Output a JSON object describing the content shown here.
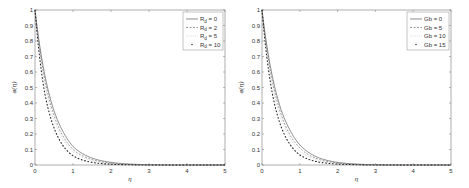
{
  "chart_data": [
    {
      "type": "line",
      "title": "",
      "xlabel": "η",
      "ylabel": "φ(η)",
      "xlim": [
        0,
        5
      ],
      "ylim": [
        0,
        1
      ],
      "xticks": [
        "0",
        "1",
        "2",
        "3",
        "4",
        "5"
      ],
      "yticks": [
        "0",
        "0.1",
        "0.2",
        "0.3",
        "0.4",
        "0.5",
        "0.6",
        "0.7",
        "0.8",
        "0.9",
        "1"
      ],
      "grid": false,
      "legend_position": "upper right",
      "x": [
        0,
        0.25,
        0.5,
        0.75,
        1,
        1.5,
        2,
        2.5,
        3,
        4,
        5
      ],
      "series": [
        {
          "name": "R_d = 0",
          "style": "solid",
          "values": [
            1,
            0.59,
            0.35,
            0.21,
            0.12,
            0.045,
            0.017,
            0.006,
            0.002,
            0.0,
            0.0
          ]
        },
        {
          "name": "R_d = 2",
          "style": "dashed",
          "values": [
            1,
            0.56,
            0.32,
            0.18,
            0.1,
            0.035,
            0.012,
            0.004,
            0.001,
            0.0,
            0.0
          ]
        },
        {
          "name": "R_d = 5",
          "style": "dotted-light",
          "values": [
            1,
            0.53,
            0.29,
            0.16,
            0.085,
            0.027,
            0.009,
            0.003,
            0.001,
            0.0,
            0.0
          ]
        },
        {
          "name": "R_d = 10",
          "style": "dotted",
          "values": [
            1,
            0.47,
            0.24,
            0.12,
            0.06,
            0.017,
            0.005,
            0.0015,
            0.0,
            0.0,
            0.0
          ]
        }
      ]
    },
    {
      "type": "line",
      "title": "",
      "xlabel": "η",
      "ylabel": "φ(η)",
      "xlim": [
        0,
        5
      ],
      "ylim": [
        0,
        1
      ],
      "xticks": [
        "0",
        "1",
        "2",
        "3",
        "4",
        "5"
      ],
      "yticks": [
        "0",
        "0.1",
        "0.2",
        "0.3",
        "0.4",
        "0.5",
        "0.6",
        "0.7",
        "0.8",
        "0.9",
        "1"
      ],
      "grid": false,
      "legend_position": "upper right",
      "x": [
        0,
        0.25,
        0.5,
        0.75,
        1,
        1.5,
        2,
        2.5,
        3,
        4,
        5
      ],
      "series": [
        {
          "name": "Gb = 0",
          "style": "solid",
          "values": [
            1,
            0.6,
            0.36,
            0.22,
            0.13,
            0.047,
            0.017,
            0.006,
            0.002,
            0.0,
            0.0
          ]
        },
        {
          "name": "Gb = 5",
          "style": "dashed",
          "values": [
            1,
            0.57,
            0.33,
            0.19,
            0.11,
            0.037,
            0.013,
            0.004,
            0.001,
            0.0,
            0.0
          ]
        },
        {
          "name": "Gb = 10",
          "style": "dotted-light",
          "values": [
            1,
            0.54,
            0.3,
            0.17,
            0.09,
            0.029,
            0.009,
            0.003,
            0.001,
            0.0,
            0.0
          ]
        },
        {
          "name": "Gb = 15",
          "style": "dotted",
          "values": [
            1,
            0.49,
            0.25,
            0.13,
            0.065,
            0.019,
            0.006,
            0.002,
            0.0,
            0.0,
            0.0
          ]
        }
      ]
    }
  ],
  "left_panel": {
    "ylabel": "φ(η)",
    "xlabel": "η",
    "legend": [
      {
        "base": "R",
        "sub": "d",
        "rest": " = 0"
      },
      {
        "base": "R",
        "sub": "d",
        "rest": " = 2"
      },
      {
        "base": "R",
        "sub": "d",
        "rest": " = 5"
      },
      {
        "base": "R",
        "sub": "d",
        "rest": " = 10"
      }
    ]
  },
  "right_panel": {
    "ylabel": "φ(η)",
    "xlabel": "η",
    "legend": [
      {
        "label": "Gb = 0"
      },
      {
        "label": "Gb = 5"
      },
      {
        "label": "Gb = 10"
      },
      {
        "label": "Gb = 15"
      }
    ]
  },
  "colors": {
    "axis": "#555555",
    "curve": "#333333",
    "light_curve": "#999999",
    "background": "#ffffff"
  }
}
